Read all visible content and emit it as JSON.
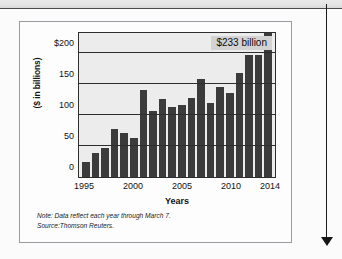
{
  "figure": {
    "callout_label": "$233 billion",
    "note": "Note: Data reflect each year through March 7.",
    "source": "Source:Thomson Reuters."
  },
  "colors": {
    "bar": "#3b3b3b",
    "plot_background": "#ececed",
    "callout_background": "#d3d3d4",
    "axis": "#2e2e2e",
    "page_border": "#9a9aa0"
  },
  "chart_data": {
    "type": "bar",
    "title": "",
    "xlabel": "Years",
    "ylabel": "($ in billions)",
    "categories": [
      "1995",
      "1996",
      "1997",
      "1998",
      "1999",
      "2000",
      "2001",
      "2002",
      "2003",
      "2004",
      "2005",
      "2006",
      "2007",
      "2008",
      "2009",
      "2010",
      "2011",
      "2012",
      "2013",
      "2014"
    ],
    "values": [
      25,
      39,
      47,
      77,
      71,
      63,
      140,
      107,
      126,
      114,
      116,
      128,
      159,
      119,
      145,
      136,
      169,
      197,
      198,
      233
    ],
    "ylim": [
      0,
      233
    ],
    "yticks": [
      0,
      50,
      100,
      150,
      200
    ],
    "ytick_labels": [
      "0",
      "50",
      "100",
      "150",
      "$200"
    ],
    "xtick_labels": [
      "1995",
      "2000",
      "2005",
      "2010",
      "2014"
    ],
    "xtick_categories": [
      "1995",
      "2000",
      "2005",
      "2010",
      "2014"
    ],
    "grid": true,
    "legend": "none",
    "annotations": [
      {
        "text": "$233 billion",
        "target_category": "2014",
        "value": 233
      }
    ]
  }
}
